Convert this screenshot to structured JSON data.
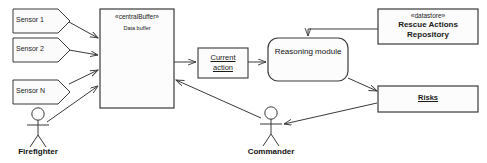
{
  "diagram": {
    "style": {
      "stroke": "#3a3a3a",
      "fill": "#fdfdfd",
      "text": "#1a1a1a"
    },
    "sensors": [
      {
        "label": "Sensor 1"
      },
      {
        "label": "Sensor 2"
      },
      {
        "label": "Sensor N"
      }
    ],
    "central_buffer": {
      "stereotype": "«centralBuffer»",
      "label": "Data buffer"
    },
    "current_action": {
      "line1": "Current",
      "line2": "action"
    },
    "reasoning_module": {
      "label": "Reasoning module"
    },
    "repository": {
      "stereotype": "«datastore»",
      "line1": "Rescue Actions",
      "line2": "Repository"
    },
    "risks": {
      "label": "Risks"
    },
    "actors": [
      {
        "label": "Firefighter"
      },
      {
        "label": "Commander"
      }
    ]
  }
}
